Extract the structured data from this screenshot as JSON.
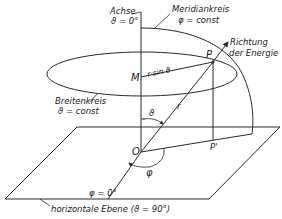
{
  "diagram": {
    "type": "spherical-coordinates",
    "labels": {
      "axis_title": "Achse",
      "axis_value": "ϑ = 0°",
      "meridian_title": "Meridiankreis",
      "meridian_value": "φ = const",
      "direction_line1": "Richtung",
      "direction_line2": "der Energie",
      "point_p": "P",
      "point_m": "M",
      "radius_projection": "r·sin ϑ",
      "latitude_title": "Breitenkreis",
      "latitude_value": "ϑ = const",
      "radius": "r",
      "theta": "ϑ",
      "origin": "O",
      "point_p_prime": "P'",
      "phi_zero": "φ = 0°",
      "phi": "φ",
      "plane_label": "horizontale Ebene (ϑ = 90°)"
    },
    "colors": {
      "line": "#2a2a2a",
      "text": "#1a1a1a",
      "background": "#ffffff"
    }
  }
}
